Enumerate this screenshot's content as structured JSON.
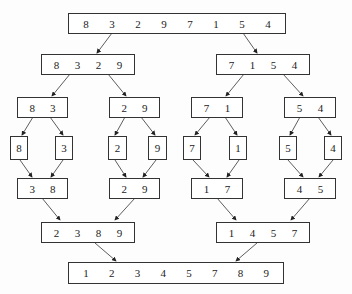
{
  "levels": {
    "l0": [
      [
        "8",
        "3",
        "2",
        "9",
        "7",
        "1",
        "5",
        "4"
      ]
    ],
    "l1": [
      [
        "8",
        "3",
        "2",
        "9"
      ],
      [
        "7",
        "1",
        "5",
        "4"
      ]
    ],
    "l2": [
      [
        "8",
        "3"
      ],
      [
        "2",
        "9"
      ],
      [
        "7",
        "1"
      ],
      [
        "5",
        "4"
      ]
    ],
    "l3": [
      [
        "8"
      ],
      [
        "3"
      ],
      [
        "2"
      ],
      [
        "9"
      ],
      [
        "7"
      ],
      [
        "1"
      ],
      [
        "5"
      ],
      [
        "4"
      ]
    ],
    "l4": [
      [
        "3",
        "8"
      ],
      [
        "2",
        "9"
      ],
      [
        "1",
        "7"
      ],
      [
        "4",
        "5"
      ]
    ],
    "l5": [
      [
        "2",
        "3",
        "8",
        "9"
      ],
      [
        "1",
        "4",
        "5",
        "7"
      ]
    ],
    "l6": [
      [
        "1",
        "2",
        "3",
        "4",
        "5",
        "7",
        "8",
        "9"
      ]
    ]
  }
}
